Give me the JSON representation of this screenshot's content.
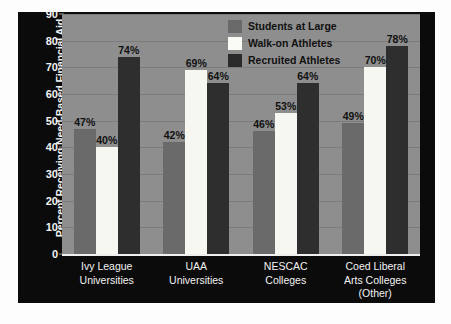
{
  "chart_data": {
    "type": "bar",
    "title": "",
    "xlabel": "",
    "ylabel": "Percent Receiving Need-Based Financial Aid",
    "ylim": [
      0,
      90
    ],
    "ytick_values": [
      90,
      80,
      70,
      60,
      50,
      40,
      30,
      20,
      10,
      0
    ],
    "ytick_labels": [
      "90",
      "80",
      "70",
      "60",
      "50",
      "40",
      "30",
      "20",
      "10",
      "0"
    ],
    "grid": true,
    "legend_position": "top-right",
    "categories": [
      "Ivy League Universities",
      "UAA Universities",
      "NESCAC Colleges",
      "Coed Liberal Arts Colleges (Other)"
    ],
    "category_lines": [
      [
        "Ivy League",
        "Universities"
      ],
      [
        "UAA",
        "Universities"
      ],
      [
        "NESCAC",
        "Colleges"
      ],
      [
        "Coed Liberal",
        "Arts Colleges",
        "(Other)"
      ]
    ],
    "series": [
      {
        "name": "Students at Large",
        "color": "#6a6a6a",
        "values": [
          47,
          42,
          46,
          49
        ],
        "labels": [
          "47%",
          "42%",
          "46%",
          "49%"
        ]
      },
      {
        "name": "Walk-on Athletes",
        "color": "#f7f7f2",
        "values": [
          40,
          69,
          53,
          70
        ],
        "labels": [
          "40%",
          "69%",
          "53%",
          "70%"
        ]
      },
      {
        "name": "Recruited Athletes",
        "color": "#2e2e2e",
        "values": [
          74,
          64,
          64,
          78
        ],
        "labels": [
          "74%",
          "64%",
          "64%",
          "78%"
        ]
      }
    ]
  },
  "colors": {
    "panel_background": "#0b0b0b",
    "plot_background": "#8e8e8e",
    "gridline": "#7b7b7b",
    "axis_text": "#f2f2f2",
    "data_label_text": "#111111",
    "baseline": "#efefef"
  }
}
